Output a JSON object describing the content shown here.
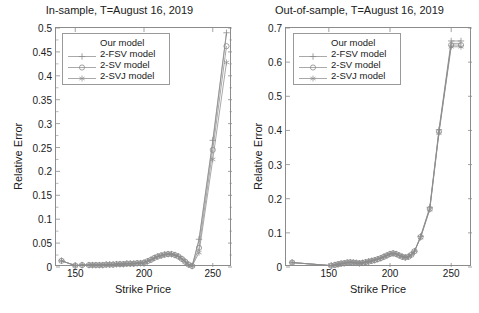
{
  "figure": {
    "width": 479,
    "height": 313,
    "background": "#ffffff",
    "line_color": "#8c8c8c",
    "axis_color": "#8c8c8c",
    "text_color": "#202020"
  },
  "panels": [
    {
      "id": "in-sample",
      "title": "In-sample, T=August 16, 2019",
      "xlabel": "Strike Price",
      "ylabel": "Relative Error",
      "xticks": [
        150,
        200,
        250
      ],
      "yticks": [
        "0",
        "0.05",
        "0.1",
        "0.15",
        "0.2",
        "0.25",
        "0.3",
        "0.35",
        "0.4",
        "0.45",
        "0.5"
      ],
      "legend": {
        "position": "upper-left",
        "entries": [
          {
            "label": "Our model",
            "marker": "none"
          },
          {
            "label": "2-FSV model",
            "marker": "plus"
          },
          {
            "label": "2-SV model",
            "marker": "circle"
          },
          {
            "label": "2-SVJ model",
            "marker": "asterisk"
          }
        ]
      }
    },
    {
      "id": "out-of-sample",
      "title": "Out-of-sample, T=August 16, 2019",
      "xlabel": "Strike Price",
      "ylabel": "Relative Error",
      "xticks": [
        150,
        200,
        250
      ],
      "yticks": [
        "0",
        "0.1",
        "0.2",
        "0.3",
        "0.4",
        "0.5",
        "0.6",
        "0.7"
      ],
      "legend": {
        "position": "upper-left",
        "entries": [
          {
            "label": "Our model",
            "marker": "none"
          },
          {
            "label": "2-FSV model",
            "marker": "plus"
          },
          {
            "label": "2-SV model",
            "marker": "circle"
          },
          {
            "label": "2-SVJ model",
            "marker": "asterisk"
          }
        ]
      }
    }
  ],
  "chart_data": [
    {
      "type": "line",
      "title": "In-sample, T=August 16, 2019",
      "xlabel": "Strike Price",
      "ylabel": "Relative Error",
      "xlim": [
        136,
        264
      ],
      "ylim": [
        0,
        0.5
      ],
      "grid": false,
      "legend_position": "upper-left",
      "x": [
        140,
        150,
        155,
        160,
        162.5,
        165,
        167.5,
        170,
        172.5,
        175,
        177.5,
        180,
        182.5,
        185,
        187.5,
        190,
        192.5,
        195,
        197.5,
        200,
        202.5,
        205,
        207.5,
        210,
        212.5,
        215,
        217.5,
        220,
        222.5,
        225,
        227.5,
        230,
        232.5,
        235,
        240,
        250,
        260
      ],
      "series": [
        {
          "name": "Our model",
          "marker": "none",
          "values": [
            0.013,
            0.003,
            0.004,
            0.004,
            0.004,
            0.004,
            0.004,
            0.004,
            0.005,
            0.005,
            0.005,
            0.006,
            0.006,
            0.006,
            0.007,
            0.007,
            0.007,
            0.008,
            0.008,
            0.009,
            0.012,
            0.015,
            0.019,
            0.022,
            0.024,
            0.026,
            0.027,
            0.027,
            0.025,
            0.022,
            0.017,
            0.011,
            0.005,
            0.002,
            0.055,
            0.26,
            0.49
          ]
        },
        {
          "name": "2-FSV model",
          "marker": "plus",
          "values": [
            0.013,
            0.003,
            0.004,
            0.004,
            0.004,
            0.004,
            0.004,
            0.004,
            0.005,
            0.005,
            0.005,
            0.006,
            0.006,
            0.006,
            0.007,
            0.007,
            0.007,
            0.008,
            0.008,
            0.009,
            0.012,
            0.015,
            0.019,
            0.022,
            0.024,
            0.026,
            0.027,
            0.027,
            0.025,
            0.022,
            0.017,
            0.011,
            0.005,
            0.002,
            0.058,
            0.265,
            0.49
          ]
        },
        {
          "name": "2-SV model",
          "marker": "circle",
          "values": [
            0.013,
            0.003,
            0.004,
            0.004,
            0.004,
            0.004,
            0.004,
            0.004,
            0.005,
            0.005,
            0.005,
            0.006,
            0.006,
            0.006,
            0.007,
            0.007,
            0.007,
            0.008,
            0.008,
            0.009,
            0.012,
            0.015,
            0.019,
            0.022,
            0.024,
            0.026,
            0.027,
            0.027,
            0.025,
            0.022,
            0.017,
            0.011,
            0.005,
            0.002,
            0.04,
            0.245,
            0.462
          ]
        },
        {
          "name": "2-SVJ model",
          "marker": "asterisk",
          "values": [
            0.013,
            0.003,
            0.004,
            0.004,
            0.004,
            0.004,
            0.004,
            0.004,
            0.005,
            0.005,
            0.005,
            0.006,
            0.006,
            0.006,
            0.007,
            0.007,
            0.007,
            0.008,
            0.008,
            0.009,
            0.012,
            0.015,
            0.019,
            0.022,
            0.024,
            0.026,
            0.027,
            0.027,
            0.025,
            0.022,
            0.017,
            0.011,
            0.005,
            0.002,
            0.03,
            0.225,
            0.428
          ]
        }
      ]
    },
    {
      "type": "line",
      "title": "Out-of-sample, T=August 16, 2019",
      "xlabel": "Strike Price",
      "ylabel": "Relative Error",
      "xlim": [
        115,
        267
      ],
      "ylim": [
        0,
        0.7
      ],
      "grid": false,
      "legend_position": "upper-left",
      "x": [
        120,
        152,
        155,
        157.5,
        160,
        162.5,
        165,
        167.5,
        170,
        172.5,
        175,
        177.5,
        180,
        182.5,
        185,
        187.5,
        190,
        192.5,
        195,
        197.5,
        200,
        202.5,
        205,
        207.5,
        210,
        212.5,
        215,
        217.5,
        220,
        225,
        232.5,
        240,
        250,
        258
      ],
      "series": [
        {
          "name": "Our model",
          "marker": "none",
          "values": [
            0.013,
            0.004,
            0.006,
            0.008,
            0.01,
            0.011,
            0.013,
            0.014,
            0.013,
            0.012,
            0.011,
            0.012,
            0.014,
            0.016,
            0.018,
            0.02,
            0.023,
            0.026,
            0.03,
            0.034,
            0.038,
            0.04,
            0.038,
            0.034,
            0.03,
            0.028,
            0.03,
            0.036,
            0.046,
            0.088,
            0.172,
            0.398,
            0.655,
            0.655
          ]
        },
        {
          "name": "2-FSV model",
          "marker": "plus",
          "values": [
            0.013,
            0.004,
            0.006,
            0.008,
            0.01,
            0.011,
            0.013,
            0.014,
            0.013,
            0.012,
            0.011,
            0.012,
            0.014,
            0.016,
            0.018,
            0.02,
            0.023,
            0.026,
            0.03,
            0.034,
            0.038,
            0.04,
            0.038,
            0.034,
            0.03,
            0.028,
            0.03,
            0.036,
            0.046,
            0.09,
            0.175,
            0.402,
            0.662,
            0.662
          ]
        },
        {
          "name": "2-SV model",
          "marker": "circle",
          "values": [
            0.013,
            0.004,
            0.006,
            0.008,
            0.01,
            0.011,
            0.013,
            0.014,
            0.013,
            0.012,
            0.011,
            0.012,
            0.014,
            0.016,
            0.018,
            0.02,
            0.023,
            0.026,
            0.03,
            0.034,
            0.038,
            0.04,
            0.038,
            0.034,
            0.03,
            0.028,
            0.03,
            0.036,
            0.046,
            0.088,
            0.17,
            0.396,
            0.65,
            0.65
          ]
        },
        {
          "name": "2-SVJ model",
          "marker": "asterisk",
          "values": [
            0.013,
            0.004,
            0.006,
            0.008,
            0.01,
            0.011,
            0.013,
            0.014,
            0.013,
            0.012,
            0.011,
            0.012,
            0.014,
            0.016,
            0.018,
            0.02,
            0.023,
            0.026,
            0.03,
            0.034,
            0.038,
            0.04,
            0.038,
            0.034,
            0.03,
            0.028,
            0.03,
            0.036,
            0.046,
            0.086,
            0.168,
            0.392,
            0.645,
            0.645
          ]
        }
      ]
    }
  ]
}
